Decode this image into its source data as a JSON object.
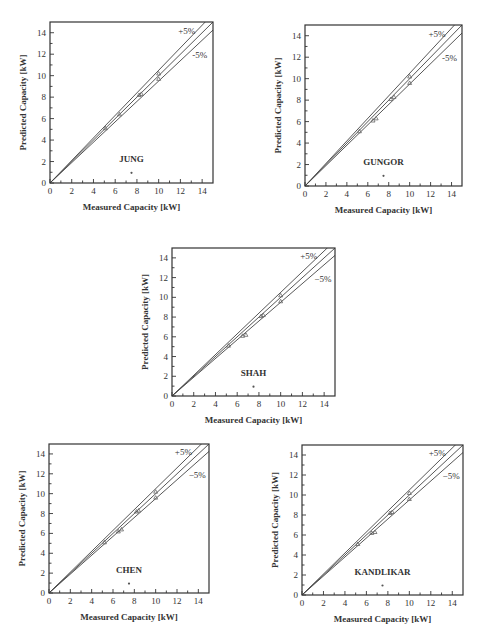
{
  "chart_data": [
    {
      "type": "scatter",
      "title": "JUNG",
      "xlabel": "Measured Capacity [kW]",
      "ylabel": "Predicted Capacity [kW]",
      "xlim": [
        0,
        15
      ],
      "ylim": [
        0,
        15
      ],
      "xticks": [
        0,
        2,
        4,
        6,
        8,
        10,
        12,
        14
      ],
      "yticks": [
        0,
        2,
        4,
        6,
        8,
        10,
        12,
        14
      ],
      "reference_lines": [
        {
          "name": "+5%",
          "slope": 1.05
        },
        {
          "name": "0%",
          "slope": 1.0
        },
        {
          "name": "-5%",
          "slope": 0.95
        }
      ],
      "band_labels": {
        "upper": "+5%",
        "lower": "-5%"
      },
      "series": [
        {
          "name": "JUNG",
          "x": [
            5.1,
            6.4,
            8.2,
            8.4,
            10.0,
            10.0
          ],
          "y": [
            5.1,
            6.4,
            8.2,
            8.3,
            9.7,
            10.2
          ]
        }
      ],
      "grid": false,
      "frame": {
        "left": 50,
        "top": 22,
        "width": 163,
        "height": 161
      }
    },
    {
      "type": "scatter",
      "title": "GUNGOR",
      "xlabel": "Measured Capacity [kW]",
      "ylabel": "Predicted Capacity [kW]",
      "xlim": [
        0,
        15
      ],
      "ylim": [
        0,
        15
      ],
      "xticks": [
        0,
        2,
        4,
        6,
        8,
        10,
        12,
        14
      ],
      "yticks": [
        0,
        2,
        4,
        6,
        8,
        10,
        12,
        14
      ],
      "reference_lines": [
        {
          "name": "+5%",
          "slope": 1.05
        },
        {
          "name": "0%",
          "slope": 1.0
        },
        {
          "name": "-5%",
          "slope": 0.95
        }
      ],
      "band_labels": {
        "upper": "+5%",
        "lower": "-5%"
      },
      "series": [
        {
          "name": "GUNGOR",
          "x": [
            5.2,
            6.5,
            6.8,
            8.2,
            8.5,
            10.0,
            10.0
          ],
          "y": [
            5.1,
            6.1,
            6.3,
            8.1,
            8.3,
            9.6,
            10.2
          ]
        }
      ],
      "grid": false,
      "frame": {
        "left": 305,
        "top": 25,
        "width": 157,
        "height": 161
      }
    },
    {
      "type": "scatter",
      "title": "SHAH",
      "xlabel": "Measured Capacity [kW]",
      "ylabel": "Predicted Capacity [kW]",
      "xlim": [
        0,
        15
      ],
      "ylim": [
        0,
        15
      ],
      "xticks": [
        0,
        2,
        4,
        6,
        8,
        10,
        12,
        14
      ],
      "yticks": [
        0,
        2,
        4,
        6,
        8,
        10,
        12,
        14
      ],
      "reference_lines": [
        {
          "name": "+5%",
          "slope": 1.05
        },
        {
          "name": "0%",
          "slope": 1.0
        },
        {
          "name": "-5%",
          "slope": 0.95
        }
      ],
      "band_labels": {
        "upper": "+5%",
        "lower": "−5%"
      },
      "series": [
        {
          "name": "SHAH",
          "x": [
            5.2,
            6.5,
            6.8,
            8.2,
            8.4,
            10.0,
            10.0
          ],
          "y": [
            5.1,
            6.1,
            6.2,
            8.1,
            8.2,
            9.6,
            10.2
          ]
        }
      ],
      "grid": false,
      "frame": {
        "left": 172,
        "top": 248,
        "width": 163,
        "height": 148
      }
    },
    {
      "type": "scatter",
      "title": "CHEN",
      "xlabel": "Measured Capacity [kW]",
      "ylabel": "Predicted Capacity [kW]",
      "xlim": [
        0,
        15
      ],
      "ylim": [
        0,
        15
      ],
      "xticks": [
        0,
        2,
        4,
        6,
        8,
        10,
        12,
        14
      ],
      "yticks": [
        0,
        2,
        4,
        6,
        8,
        10,
        12,
        14
      ],
      "reference_lines": [
        {
          "name": "+5%",
          "slope": 1.05
        },
        {
          "name": "0%",
          "slope": 1.0
        },
        {
          "name": "-5%",
          "slope": 0.95
        }
      ],
      "band_labels": {
        "upper": "+5%",
        "lower": "−5%"
      },
      "series": [
        {
          "name": "CHEN",
          "x": [
            5.2,
            6.5,
            6.8,
            8.2,
            8.4,
            10.0,
            10.0
          ],
          "y": [
            5.1,
            6.2,
            6.4,
            8.2,
            8.3,
            9.6,
            10.2
          ]
        }
      ],
      "grid": false,
      "frame": {
        "left": 49,
        "top": 444,
        "width": 160,
        "height": 149
      }
    },
    {
      "type": "scatter",
      "title": "KANDLIKAR",
      "xlabel": "Measured Capacity [kW]",
      "ylabel": "Predicted Capacity [kW]",
      "xlim": [
        0,
        15
      ],
      "ylim": [
        0,
        15
      ],
      "xticks": [
        0,
        2,
        4,
        6,
        8,
        10,
        12,
        14
      ],
      "yticks": [
        0,
        2,
        4,
        6,
        8,
        10,
        12,
        14
      ],
      "reference_lines": [
        {
          "name": "+5%",
          "slope": 1.05
        },
        {
          "name": "0%",
          "slope": 1.0
        },
        {
          "name": "-5%",
          "slope": 0.95
        }
      ],
      "band_labels": {
        "upper": "+5%",
        "lower": "−5%"
      },
      "series": [
        {
          "name": "KANDLIKAR",
          "x": [
            5.2,
            6.5,
            6.8,
            8.2,
            8.4,
            10.0,
            10.0
          ],
          "y": [
            5.1,
            6.2,
            6.3,
            8.2,
            8.3,
            9.6,
            10.2
          ]
        }
      ],
      "grid": false,
      "frame": {
        "left": 302,
        "top": 445,
        "width": 161,
        "height": 150
      }
    }
  ],
  "panels": [
    {
      "name": "JUNG",
      "upper": "+5%",
      "lower": "-5%",
      "xlabel": "Measured Capacity [kW]",
      "ylabel": "Predicted Capacity [kW]"
    },
    {
      "name": "GUNGOR",
      "upper": "+5%",
      "lower": "-5%",
      "xlabel": "Measured Capacity [kW]",
      "ylabel": "Predicted Capacity [kW]"
    },
    {
      "name": "SHAH",
      "upper": "+5%",
      "lower": "−5%",
      "xlabel": "Measured Capacity [kW]",
      "ylabel": "Predicted Capacity [kW]"
    },
    {
      "name": "CHEN",
      "upper": "+5%",
      "lower": "−5%",
      "xlabel": "Measured Capacity [kW]",
      "ylabel": "Predicted Capacity [kW]"
    },
    {
      "name": "KANDLIKAR",
      "upper": "+5%",
      "lower": "−5%",
      "xlabel": "Measured Capacity [kW]",
      "ylabel": "Predicted Capacity [kW]"
    }
  ]
}
